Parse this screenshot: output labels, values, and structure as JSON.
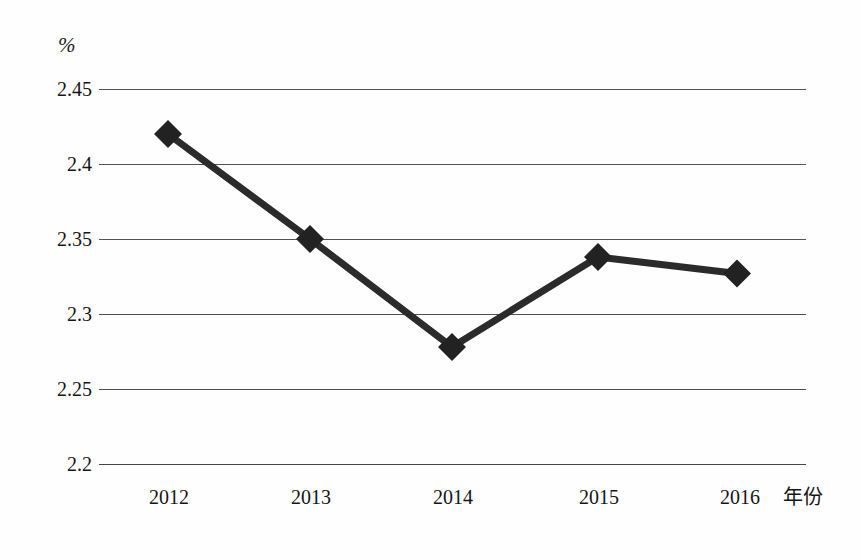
{
  "chart_data": {
    "type": "line",
    "title": "",
    "subtitle": "",
    "xlabel": "年份",
    "ylabel": "%",
    "unit_label": "%",
    "categories": [
      "2012",
      "2013",
      "2014",
      "2015",
      "2016"
    ],
    "x": [
      2012,
      2013,
      2014,
      2015,
      2016
    ],
    "series": [
      {
        "name": "",
        "values": [
          2.42,
          2.35,
          2.278,
          2.338,
          2.327
        ]
      }
    ],
    "values": [
      2.42,
      2.35,
      2.278,
      2.338,
      2.327
    ],
    "ylim": [
      2.2,
      2.45
    ],
    "yticks": [
      "2.45",
      "2.4",
      "2.35",
      "2.3",
      "2.25",
      "2.2"
    ],
    "ytick_values": [
      2.45,
      2.4,
      2.35,
      2.3,
      2.25,
      2.2
    ],
    "xticks": [
      "2012",
      "2013",
      "2014",
      "2015",
      "2016"
    ],
    "grid": "horizontal",
    "legend": "none",
    "marker": "diamond",
    "line_color": "#2b2b2b",
    "marker_color": "#222222",
    "grid_color": "#3a3a3a",
    "background_color": "#fefefe"
  },
  "axes": {
    "unit": "%",
    "x_title": "年份",
    "y_ticks": [
      {
        "label": "2.45"
      },
      {
        "label": "2.4"
      },
      {
        "label": "2.35"
      },
      {
        "label": "2.3"
      },
      {
        "label": "2.25"
      },
      {
        "label": "2.2"
      }
    ],
    "x_ticks": [
      {
        "label": "2012"
      },
      {
        "label": "2013"
      },
      {
        "label": "2014"
      },
      {
        "label": "2015"
      },
      {
        "label": "2016"
      }
    ]
  }
}
